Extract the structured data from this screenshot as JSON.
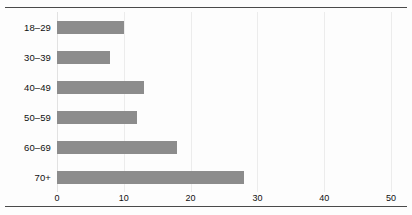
{
  "figure": {
    "clipped_title_fragment": "",
    "background_color": "#fdfdfd",
    "rule_color": "#4a4a4a",
    "bar_color": "#8c8c8c",
    "gridline_color": "#ececec"
  },
  "chart_data": {
    "type": "bar",
    "orientation": "horizontal",
    "title": "",
    "xlabel": "",
    "ylabel": "",
    "categories": [
      "18–29",
      "30–39",
      "40–49",
      "50–59",
      "60–69",
      "70+"
    ],
    "values": [
      10,
      8,
      13,
      12,
      18,
      28
    ],
    "xlim": [
      0,
      50
    ],
    "xticks": [
      0,
      10,
      20,
      30,
      40,
      50
    ],
    "xtick_labels": [
      "0",
      "10",
      "20",
      "30",
      "40",
      "50"
    ],
    "grid": true,
    "grid_axis": "x",
    "legend": false,
    "series": [
      {
        "name": "",
        "color": "#8c8c8c",
        "values": [
          10,
          8,
          13,
          12,
          18,
          28
        ]
      }
    ]
  }
}
